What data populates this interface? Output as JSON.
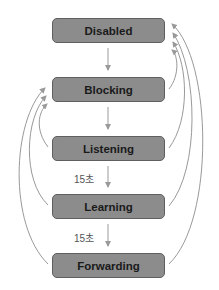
{
  "diagram": {
    "type": "state-transition",
    "states": [
      {
        "id": "disabled",
        "label": "Disabled"
      },
      {
        "id": "blocking",
        "label": "Blocking"
      },
      {
        "id": "listening",
        "label": "Listening"
      },
      {
        "id": "learning",
        "label": "Learning"
      },
      {
        "id": "forwarding",
        "label": "Forwarding"
      }
    ],
    "transitions": [
      {
        "from": "disabled",
        "to": "blocking",
        "label": ""
      },
      {
        "from": "blocking",
        "to": "listening",
        "label": ""
      },
      {
        "from": "listening",
        "to": "learning",
        "label": "15초"
      },
      {
        "from": "learning",
        "to": "forwarding",
        "label": "15초"
      },
      {
        "from": "blocking",
        "to": "disabled",
        "label": ""
      },
      {
        "from": "listening",
        "to": "disabled",
        "label": ""
      },
      {
        "from": "learning",
        "to": "disabled",
        "label": ""
      },
      {
        "from": "forwarding",
        "to": "disabled",
        "label": ""
      },
      {
        "from": "listening",
        "to": "blocking",
        "label": ""
      },
      {
        "from": "learning",
        "to": "blocking",
        "label": ""
      },
      {
        "from": "forwarding",
        "to": "blocking",
        "label": ""
      }
    ],
    "timers": [
      "15초",
      "15초"
    ],
    "colors": {
      "box_fill": "#8c8c8c",
      "box_border": "#5f5f5f",
      "arrow": "#999999",
      "text": "#1a1a1a"
    }
  }
}
